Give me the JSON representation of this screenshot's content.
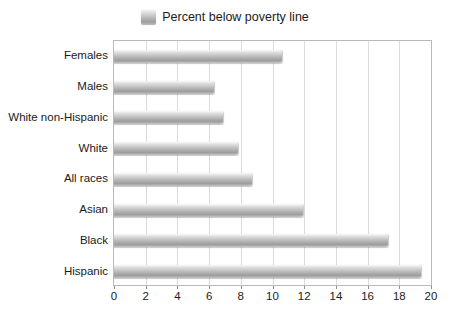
{
  "legend": {
    "swatch_name": "legend-color-swatch",
    "label": "Percent below poverty line",
    "position": "top-center"
  },
  "axis": {
    "x_ticks": [
      "0",
      "2",
      "4",
      "6",
      "8",
      "10",
      "12",
      "14",
      "16",
      "18",
      "20"
    ],
    "y_categories": [
      "Females",
      "Males",
      "White non-Hispanic",
      "White",
      "All races",
      "Asian",
      "Black",
      "Hispanic"
    ]
  },
  "colors": {
    "bar_light": "#fbfbfb",
    "bar_mid": "#c9c9c9",
    "bar_dark": "#9d9d9d",
    "grid": "#dcdcdc",
    "frame": "#b9b9b9",
    "text": "#1b1b1b",
    "background": "#ffffff"
  },
  "chart_data": {
    "type": "bar",
    "orientation": "horizontal",
    "title": "",
    "subtitle": "",
    "xlabel": "",
    "ylabel": "",
    "xlim": [
      0,
      20
    ],
    "xtick_step": 2,
    "grid": true,
    "legend": [
      "Percent below poverty line"
    ],
    "legend_position": "top-center",
    "categories": [
      "Females",
      "Males",
      "White non-Hispanic",
      "White",
      "All races",
      "Asian",
      "Black",
      "Hispanic"
    ],
    "series": [
      {
        "name": "Percent below poverty line",
        "values": [
          10.6,
          6.3,
          6.9,
          7.8,
          8.7,
          11.9,
          17.3,
          19.4
        ]
      }
    ],
    "annotations": []
  }
}
